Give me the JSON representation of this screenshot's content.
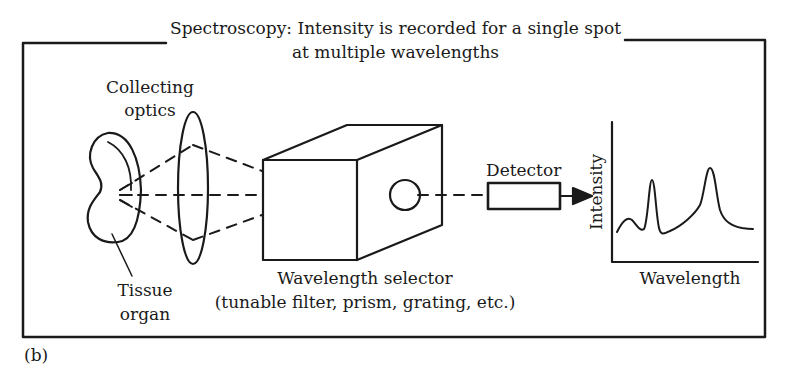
{
  "title": {
    "line1": "Spectroscopy: Intensity is recorded for a single spot",
    "line2": "at multiple wavelengths"
  },
  "labels": {
    "collecting_optics_line1": "Collecting",
    "collecting_optics_line2": "optics",
    "tissue_line1": "Tissue",
    "tissue_line2": "organ",
    "selector_line1": "Wavelength selector",
    "selector_line2": "(tunable filter, prism, grating, etc.)",
    "detector": "Detector",
    "panel": "(b)"
  },
  "plot": {
    "ylabel": "Intensity",
    "xlabel": "Wavelength"
  },
  "colors": {
    "ink": "#1a1a1a",
    "background": "#ffffff"
  }
}
